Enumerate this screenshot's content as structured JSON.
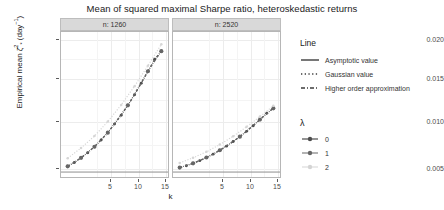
{
  "chart_data": {
    "type": "line",
    "title": "Mean of squared maximal Sharpe ratio, heteroskedastic returns",
    "xlabel": "k",
    "ylabel": "Empirical mean ζ̂²* (day⁻¹)",
    "ylabel_parts": {
      "lead": "Empirical mean ",
      "symbol": "ζ",
      "sup": "^2",
      "sub": "*",
      "unit": " (day",
      "unit_sup": "−1",
      "unit_tail": ")"
    },
    "xlim": [
      1,
      17
    ],
    "ylim": [
      0.0042,
      0.0212
    ],
    "xticks": [
      5,
      10,
      15
    ],
    "yticks": [
      0.005,
      0.01,
      0.015,
      0.02
    ],
    "ytick_labels": [
      "0.005",
      "0.010",
      "0.015",
      "0.020"
    ],
    "xtick_labels": [
      "5",
      "10",
      "15"
    ],
    "grid": true,
    "legend_position": "right",
    "facet_variable": "n",
    "panels": [
      {
        "label": "n: 1260",
        "n": 1260,
        "series": [
          {
            "name": "λ = 0",
            "lambda": 0,
            "line": "Higher order approximation",
            "color": "#4d4d4d",
            "x": [
              2,
              3,
              4,
              5,
              6,
              7,
              8,
              9,
              10,
              11,
              12,
              13,
              14,
              15,
              16
            ],
            "y": [
              0.00545,
              0.0059,
              0.00645,
              0.00705,
              0.00775,
              0.00855,
              0.0094,
              0.0104,
              0.01145,
              0.0126,
              0.01385,
              0.0152,
              0.0166,
              0.018,
              0.01895
            ]
          },
          {
            "name": "λ = 1",
            "lambda": 1,
            "line": "Higher order approximation",
            "color": "#666666",
            "x": [
              2,
              4,
              6,
              8,
              11,
              14,
              16
            ],
            "y": [
              0.00545,
              0.00645,
              0.00775,
              0.0094,
              0.0126,
              0.0166,
              0.01895
            ]
          },
          {
            "name": "λ = 2",
            "lambda": 2,
            "line": "Gaussian value",
            "color": "#d6d6d6",
            "x": [
              2,
              4,
              6,
              8,
              10,
              12,
              14,
              16
            ],
            "y": [
              0.0064,
              0.0076,
              0.009,
              0.0107,
              0.01265,
              0.01485,
              0.01725,
              0.01975
            ]
          },
          {
            "name": "Asymptotic value",
            "lambda": null,
            "line": "Asymptotic value",
            "color": "#8c8c8c",
            "x": [
              1,
              17
            ],
            "y": [
              0.00478,
              0.00478
            ]
          }
        ]
      },
      {
        "label": "n: 2520",
        "n": 2520,
        "series": [
          {
            "name": "λ = 0",
            "lambda": 0,
            "line": "Higher order approximation",
            "color": "#4d4d4d",
            "x": [
              2,
              3,
              4,
              5,
              6,
              7,
              8,
              9,
              10,
              11,
              12,
              13,
              14,
              15,
              16
            ],
            "y": [
              0.0053,
              0.00553,
              0.0058,
              0.00612,
              0.00648,
              0.00688,
              0.00733,
              0.00782,
              0.00835,
              0.00893,
              0.00955,
              0.01022,
              0.01093,
              0.01168,
              0.01225
            ]
          },
          {
            "name": "λ = 1",
            "lambda": 1,
            "line": "Higher order approximation",
            "color": "#666666",
            "x": [
              2,
              4,
              6,
              8,
              11,
              14,
              16
            ],
            "y": [
              0.0053,
              0.0058,
              0.00648,
              0.00733,
              0.00893,
              0.01093,
              0.01225
            ]
          },
          {
            "name": "λ = 2",
            "lambda": 2,
            "line": "Gaussian value",
            "color": "#d6d6d6",
            "x": [
              2,
              4,
              6,
              8,
              10,
              12,
              14,
              16
            ],
            "y": [
              0.00585,
              0.00645,
              0.00715,
              0.008,
              0.00898,
              0.01008,
              0.01128,
              0.01255
            ]
          },
          {
            "name": "Asymptotic value",
            "lambda": null,
            "line": "Asymptotic value",
            "color": "#8c8c8c",
            "x": [
              1,
              17
            ],
            "y": [
              0.00478,
              0.00478
            ]
          }
        ]
      }
    ]
  },
  "title": "Mean of squared maximal Sharpe ratio, heteroskedastic returns",
  "panels": [
    {
      "strip_label": "n: 1260"
    },
    {
      "strip_label": "n: 2520"
    }
  ],
  "axes": {
    "x_title": "k",
    "x_ticks": [
      "5",
      "10",
      "15"
    ],
    "y_ticks": [
      "0.005",
      "0.010",
      "0.015",
      "0.020"
    ]
  },
  "legend_line": {
    "title": "Line",
    "items": [
      {
        "label": "Asymptotic value",
        "style": "solid"
      },
      {
        "label": "Gaussian value",
        "style": "dotted"
      },
      {
        "label": "Higher order approximation",
        "style": "dashdot"
      }
    ]
  },
  "legend_lambda": {
    "title": "λ",
    "items": [
      {
        "label": "0",
        "color": "#4d4d4d"
      },
      {
        "label": "1",
        "color": "#808080"
      },
      {
        "label": "2",
        "color": "#d4d4d4"
      }
    ]
  }
}
